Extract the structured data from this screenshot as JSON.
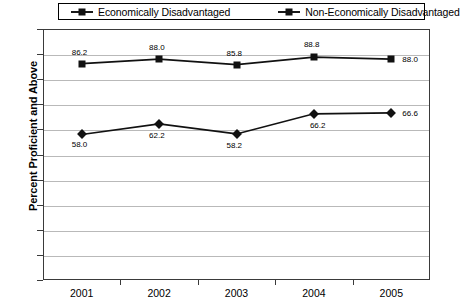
{
  "chart_data": {
    "type": "line",
    "title": "",
    "xlabel": "",
    "ylabel": "Percent Proficient and Above",
    "categories": [
      "2001",
      "2002",
      "2003",
      "2004",
      "2005"
    ],
    "ylim": [
      0,
      100
    ],
    "yticks": [
      "0",
      "10",
      "20",
      "30",
      "40",
      "50",
      "60",
      "70",
      "80",
      "90",
      "100"
    ],
    "grid": true,
    "legend_position": "top",
    "series": [
      {
        "name": "Economically Disadvantaged",
        "marker": "diamond",
        "color": "#111111",
        "values": [
          58.0,
          62.2,
          58.2,
          66.2,
          66.6
        ],
        "labels": [
          "58.0",
          "62.2",
          "58.2",
          "66.2",
          "66.6"
        ]
      },
      {
        "name": "Non-Economically Disadvantaged",
        "marker": "square",
        "color": "#111111",
        "values": [
          86.2,
          88.0,
          85.8,
          88.8,
          88.0
        ],
        "labels": [
          "86.2",
          "88.0",
          "85.8",
          "88.8",
          "88.0"
        ]
      }
    ]
  },
  "legend": {
    "entries": [
      {
        "label": "Economically Disadvantaged",
        "marker": "diamond"
      },
      {
        "label": "Non-Economically Disadvantaged",
        "marker": "square"
      }
    ]
  }
}
